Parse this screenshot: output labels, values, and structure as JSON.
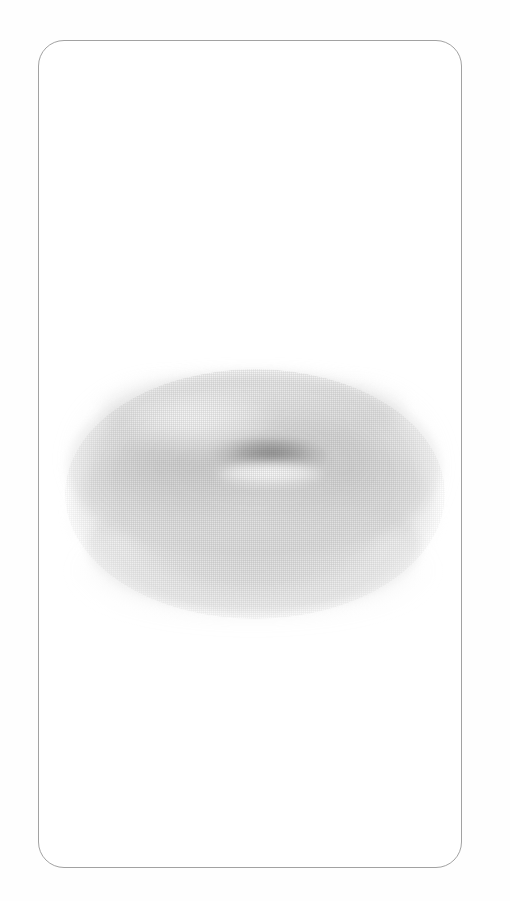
{
  "page": {
    "background_color": "#fefefe",
    "width": 510,
    "height": 901
  },
  "card": {
    "name": "illustration-card",
    "border_color": "#a2a2a2",
    "border_radius_px": 26,
    "background_color": "#ffffff",
    "bounds": {
      "x": 38,
      "y": 40,
      "width": 424,
      "height": 828
    }
  },
  "illustration": {
    "subject": "donut",
    "alt_text": "Faint pencil sketch of a ring doughnut seen at an angle",
    "style": "faded halftone pencil drawing",
    "bounds": {
      "x": 68,
      "y": 372,
      "width": 372,
      "height": 240
    },
    "palette": {
      "body": "#d4d4d4",
      "shadow": "#bebebe",
      "hole": "#8a8a8a",
      "highlight": "#ffffff",
      "texture": "#a4a4a4"
    },
    "parts": [
      {
        "name": "top-surface",
        "label": "Top surface of the doughnut"
      },
      {
        "name": "side-wall",
        "label": "Side wall / thickness of the doughnut"
      },
      {
        "name": "center-hole",
        "label": "Center hole"
      },
      {
        "name": "hole-lip",
        "label": "Highlighted lip below the hole"
      },
      {
        "name": "cast-shadow",
        "label": "Soft cast shadow beneath"
      }
    ]
  }
}
